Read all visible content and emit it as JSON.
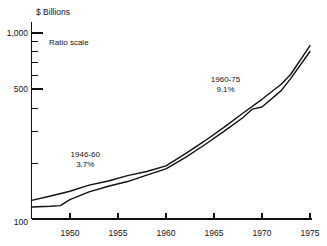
{
  "chart_data": {
    "type": "line",
    "title": "$ Billions",
    "xlabel": "",
    "ylabel": "$ Billions",
    "scale_note": "Ratio scale",
    "yscale": "log",
    "ylim": [
      100,
      1000
    ],
    "xlim": [
      1946,
      1975
    ],
    "grid": false,
    "legend_position": "none",
    "ytick_labels": [
      "1,000",
      "500",
      "100"
    ],
    "ytick_values": [
      1000,
      500,
      100
    ],
    "yminor_values": [
      900,
      800,
      700,
      600,
      400,
      300,
      200
    ],
    "xtick_labels": [
      "1950",
      "1955",
      "1960",
      "1965",
      "1970",
      "1975"
    ],
    "xtick_values": [
      1950,
      1955,
      1960,
      1965,
      1970,
      1975
    ],
    "series": [
      {
        "name": "upper",
        "x": [
          1946,
          1948,
          1950,
          1952,
          1954,
          1956,
          1958,
          1960,
          1962,
          1964,
          1966,
          1968,
          1970,
          1972,
          1973,
          1975
        ],
        "values": [
          126,
          133,
          141,
          152,
          160,
          171,
          180,
          193,
          224,
          262,
          310,
          370,
          440,
          530,
          600,
          855
        ]
      },
      {
        "name": "lower",
        "x": [
          1946,
          1948,
          1949,
          1950,
          1952,
          1954,
          1956,
          1958,
          1960,
          1962,
          1964,
          1966,
          1968,
          1969,
          1970,
          1972,
          1973,
          1975
        ],
        "values": [
          116,
          117,
          118,
          127,
          140,
          150,
          159,
          172,
          186,
          214,
          250,
          295,
          350,
          390,
          400,
          490,
          570,
          795
        ]
      }
    ],
    "annotations": [
      {
        "period": "1946-60",
        "rate": "3.7%",
        "x": 1951.6,
        "y": 215
      },
      {
        "period": "1960-75",
        "rate": "9.1%",
        "x": 1966.2,
        "y": 545
      }
    ]
  }
}
